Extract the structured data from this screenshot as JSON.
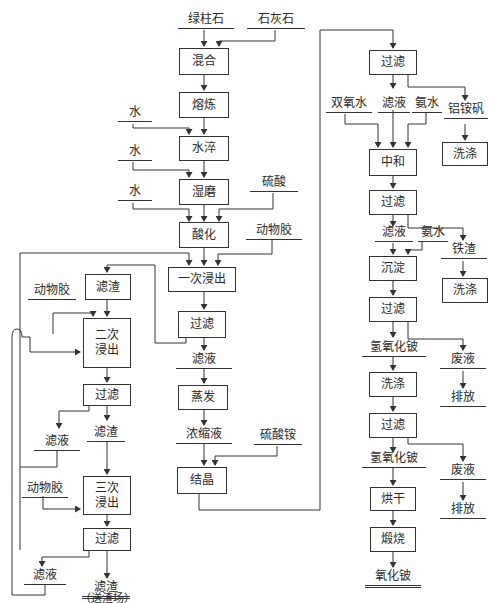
{
  "diagram": {
    "title": "",
    "inputs": {
      "beryl": "绿柱石",
      "limestone": "石灰石",
      "water_1": "水",
      "water_2": "水",
      "water_3": "水",
      "sulfuric_acid": "硫酸",
      "animal_glue_1": "动物胶",
      "animal_glue_2": "动物胶",
      "animal_glue_3": "动物胶",
      "ammonium_sulfate": "硫酸铵",
      "hydrogen_peroxide": "双氧水",
      "ammonia_1": "氨水",
      "ammonia_2": "氨水"
    },
    "process_boxes": {
      "mixing": "混合",
      "smelting": "熔炼",
      "water_quench": "水淬",
      "wet_grinding": "湿磨",
      "acidification": "酸化",
      "first_leach": "一次浸出",
      "filter_1": "过滤",
      "residue_box": "滤渣",
      "second_leach": "二次\n浸出",
      "filter_2": "过滤",
      "third_leach": "三次\n浸出",
      "filter_3": "过滤",
      "evaporation": "蒸发",
      "crystallization": "结晶",
      "filter_4": "过滤",
      "neutralization": "中和",
      "wash_alum": "洗涤",
      "filter_5": "过滤",
      "precipitation": "沉淀",
      "wash_iron": "洗涤",
      "filter_6": "过滤",
      "wash_hydroxide": "洗涤",
      "filter_7": "过滤",
      "drying": "烘干",
      "calcination": "煅烧"
    },
    "streams": {
      "filtrate_1": "滤液",
      "filtrate_2": "滤液",
      "residue_2": "滤渣",
      "filtrate_3": "滤液",
      "residue_final": "滤渣",
      "residue_final_note": "（送渣场）",
      "concentrate": "浓缩液",
      "filtrate_4": "滤液",
      "ammonium_alum": "铝铵矾",
      "filtrate_5": "滤液",
      "iron_residue": "铁渣",
      "beryllium_hydroxide_1": "氢氧化铍",
      "waste_liquid_1": "废液",
      "discharge_1": "排放",
      "beryllium_hydroxide_2": "氢氧化铍",
      "waste_liquid_2": "废液",
      "discharge_2": "排放",
      "beryllium_oxide": "氧化铍"
    }
  }
}
